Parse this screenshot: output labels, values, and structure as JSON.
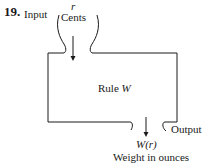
{
  "problem_number": "19.",
  "input": {
    "label": "Input",
    "variable": "r",
    "unit": "Cents"
  },
  "machine": {
    "label_prefix": "Rule ",
    "label_var": "W"
  },
  "output": {
    "label": "Output",
    "expression": "W(r)",
    "unit": "Weight in ounces"
  },
  "colors": {
    "stroke": "#1a1a1a",
    "background": "#ffffff"
  }
}
